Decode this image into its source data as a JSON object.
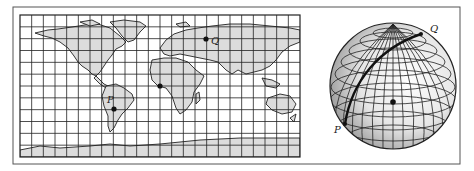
{
  "figure": {
    "frame": {
      "x": 13,
      "y": 7,
      "width": 447,
      "height": 157,
      "stroke": "#555555"
    },
    "map": {
      "projection": "equirectangular",
      "x": 20,
      "y": 15,
      "width": 280,
      "height": 142,
      "grid_columns": 24,
      "grid_rows": 12,
      "grid_spacing_deg": 15,
      "land_color": "#dcdcdc",
      "grid_color": "#222222",
      "points": [
        {
          "id": "P",
          "label": "P",
          "x": 114,
          "y": 109,
          "label_x": 107,
          "label_y": 103
        },
        {
          "id": "Q",
          "label": "Q",
          "x": 206,
          "y": 39,
          "label_x": 211,
          "label_y": 44
        },
        {
          "id": "origin",
          "label": "",
          "x": 160,
          "y": 86
        }
      ]
    },
    "globe": {
      "cx": 393,
      "cy": 86,
      "r": 63,
      "center_dot": {
        "x": 393,
        "y": 102
      },
      "shade_light": "#ffffff",
      "shade_dark": "#8a8a8a",
      "points": [
        {
          "id": "P",
          "label": "P",
          "x": 345,
          "y": 124,
          "label_x": 334,
          "label_y": 133
        },
        {
          "id": "Q",
          "label": "Q",
          "x": 421,
          "y": 34,
          "label_x": 430,
          "label_y": 32
        }
      ],
      "great_circle_path": "M345,124 C352,80 380,48 421,34"
    }
  }
}
